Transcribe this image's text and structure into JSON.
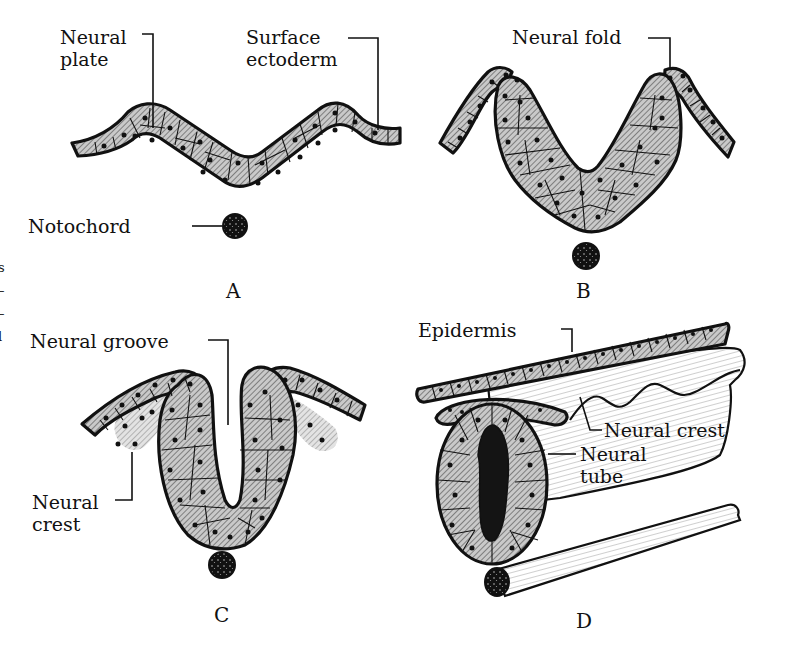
{
  "figure": {
    "panels": [
      {
        "id": "A",
        "letter": "A",
        "labels": {
          "neural_plate_line1": "Neural",
          "neural_plate_line2": "plate",
          "surface_ectoderm_line1": "Surface",
          "surface_ectoderm_line2": "ectoderm",
          "notochord": "Notochord"
        }
      },
      {
        "id": "B",
        "letter": "B",
        "labels": {
          "neural_fold": "Neural fold"
        }
      },
      {
        "id": "C",
        "letter": "C",
        "labels": {
          "neural_groove": "Neural groove",
          "neural_crest_line1": "Neural",
          "neural_crest_line2": "crest"
        }
      },
      {
        "id": "D",
        "letter": "D",
        "labels": {
          "epidermis": "Epidermis",
          "neural_crest": "Neural crest",
          "neural_tube_line1": "Neural",
          "neural_tube_line2": "tube"
        }
      }
    ],
    "edge_fragment_text": [
      "s",
      "–",
      "–",
      "l"
    ]
  }
}
